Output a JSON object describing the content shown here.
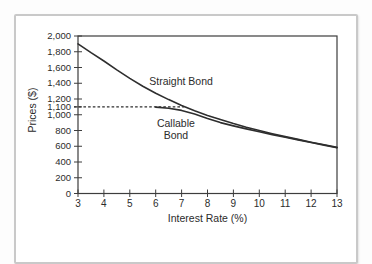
{
  "figure": {
    "background": "#ffffff",
    "frame_color": "#c9c9c9",
    "line_color": "#2e2e2e",
    "axis_color": "#3d3d3d",
    "text_color": "#2b2b2b"
  },
  "chart_data": {
    "type": "line",
    "title": "",
    "xlabel": "Interest Rate (%)",
    "ylabel": "Prices ($)",
    "xlim": [
      3,
      13
    ],
    "ylim": [
      0,
      2000
    ],
    "x_ticks": [
      3,
      4,
      5,
      6,
      7,
      8,
      9,
      10,
      11,
      12,
      13
    ],
    "x_tick_labels": [
      "3",
      "4",
      "5",
      "6",
      "7",
      "8",
      "9",
      "10",
      "11",
      "12",
      "13"
    ],
    "y_ticks": [
      0,
      200,
      400,
      600,
      800,
      1000,
      1100,
      1200,
      1400,
      1600,
      1800,
      2000
    ],
    "y_tick_labels": [
      "0",
      "200",
      "400",
      "600",
      "800",
      "1,000",
      "1,100",
      "1,200",
      "1,400",
      "1,600",
      "1,800",
      "2,000"
    ],
    "grid": false,
    "legend_position": "inline-annotations",
    "series": [
      {
        "name": "Straight Bond",
        "style": "solid",
        "x": [
          3,
          3.5,
          4,
          4.5,
          5,
          5.5,
          6,
          6.5,
          7,
          7.5,
          8,
          8.5,
          9,
          9.5,
          10,
          10.5,
          11,
          11.5,
          12,
          12.5,
          13
        ],
        "values": [
          1900,
          1788,
          1682,
          1570,
          1462,
          1362,
          1272,
          1192,
          1118,
          1052,
          992,
          938,
          888,
          842,
          800,
          760,
          722,
          687,
          652,
          618,
          585
        ]
      },
      {
        "name": "Callable Bond",
        "style": "solid",
        "x": [
          6,
          6.5,
          7,
          7.5,
          8,
          8.5,
          9,
          9.5,
          10,
          10.5,
          11,
          11.5,
          12,
          12.5,
          13
        ],
        "values": [
          1097,
          1082,
          1055,
          1010,
          952,
          900,
          858,
          820,
          783,
          748,
          714,
          680,
          648,
          615,
          582
        ]
      }
    ],
    "call_price_line": {
      "y": 1100,
      "x_start": 3,
      "x_end": 7.1,
      "style": "dashed",
      "note": "callable bond flat at call price"
    },
    "annotations": [
      {
        "text": "Straight Bond",
        "x": 6.98,
        "y": 1378
      },
      {
        "text": "Callable",
        "x": 6.78,
        "y": 844
      },
      {
        "text": "Bond",
        "x": 6.78,
        "y": 692
      }
    ]
  }
}
